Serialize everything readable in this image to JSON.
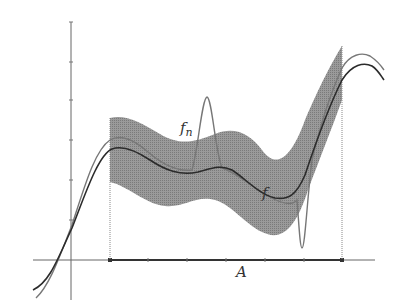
{
  "figure": {
    "labels": {
      "fn": "f",
      "fn_sub": "n",
      "f": "f",
      "set": "A"
    },
    "colors": {
      "band": "#8c8c8c",
      "f": "#2b2b2b",
      "fn": "#777777",
      "axis": "#555555",
      "background": "#ffffff"
    },
    "axes": {
      "x_axis": {
        "y": 260,
        "x_start": 33,
        "x_end": 375,
        "ticks": [
          110,
          148,
          187,
          226,
          265,
          304,
          342
        ]
      },
      "y_axis": {
        "x": 71,
        "y_start": 22,
        "y_end": 300,
        "ticks": [
          22,
          62,
          100,
          140,
          180,
          220
        ]
      }
    },
    "set_A": {
      "x_start": 110,
      "x_end": 342
    }
  }
}
